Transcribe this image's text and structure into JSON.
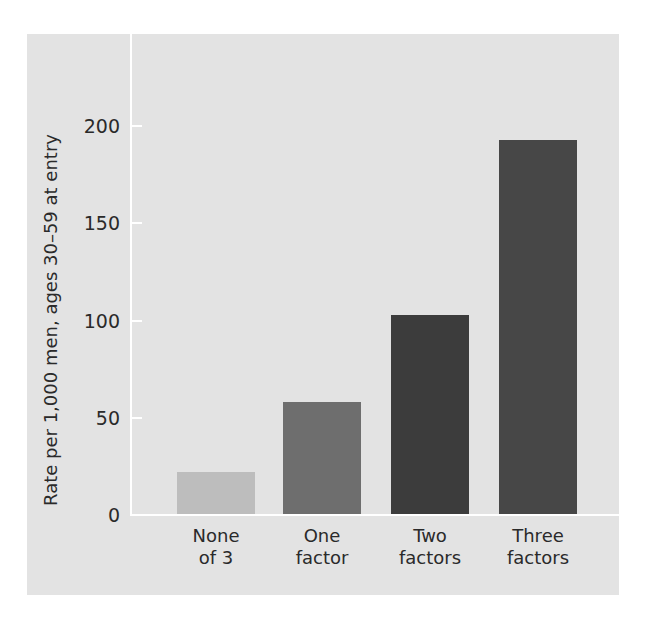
{
  "chart_data": {
    "type": "bar",
    "title": "",
    "xlabel": "",
    "ylabel": "Rate per 1,000 men, ages 30–59 at entry",
    "categories": [
      "None of 3",
      "One factor",
      "Two factors",
      "Three factors"
    ],
    "category_lines": [
      [
        "None",
        "of 3"
      ],
      [
        "One",
        "factor"
      ],
      [
        "Two",
        "factors"
      ],
      [
        "Three",
        "factors"
      ]
    ],
    "values": [
      22,
      58,
      103,
      193
    ],
    "colors": [
      "#bdbdbd",
      "#6e6e6e",
      "#3c3c3c",
      "#474747"
    ],
    "ylim": [
      0,
      200
    ],
    "yticks": [
      0,
      50,
      100,
      150,
      200
    ],
    "grid": false,
    "legend": null,
    "background": "#e3e3e3",
    "axis_color": "#ffffff"
  }
}
